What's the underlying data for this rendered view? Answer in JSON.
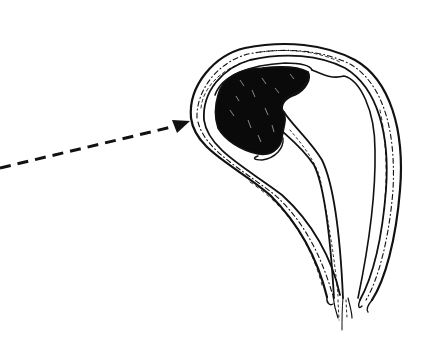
{
  "figure": {
    "type": "anatomical-line-illustration",
    "background_color": "#ffffff",
    "ink_color": "#111111",
    "mass_color": "#0a0a0a",
    "labels": []
  },
  "arrow": {
    "style": "dashed",
    "start": [
      0,
      168
    ],
    "end": [
      190,
      122
    ],
    "points_to": "outer-wall-left-side"
  },
  "elements": [
    {
      "name": "outer-wall",
      "description": "thick double-lined wall with dashed tissue texture"
    },
    {
      "name": "dark-mass",
      "description": "solid black irregular mass in upper cavity"
    },
    {
      "name": "inner-canal",
      "description": "narrow tube descending from mass to bottom"
    },
    {
      "name": "cervix-bottom",
      "description": "converging frayed ends at bottom"
    }
  ]
}
